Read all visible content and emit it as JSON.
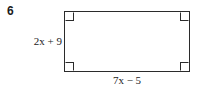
{
  "problem": {
    "number": "6"
  },
  "figure": {
    "shape_name": "rectangle",
    "height_label": "2x + 9",
    "width_label": "7x − 5",
    "right_angle_marks": 4,
    "stroke_color": "#2b2b2b",
    "fill_color": "#ffffff"
  },
  "geometry": {
    "left": 64,
    "top": 11,
    "width": 126,
    "height": 61
  }
}
